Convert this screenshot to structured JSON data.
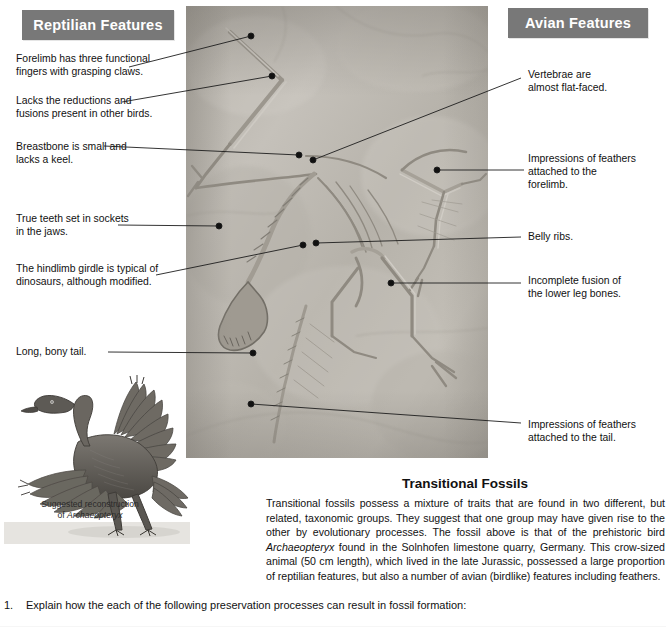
{
  "banners": {
    "reptilian": "Reptilian Features",
    "avian": "Avian Features",
    "bg_color": "#787878",
    "text_color": "#ffffff"
  },
  "callouts": {
    "left": [
      {
        "id": "forelimb-fingers",
        "text": "Forelimb has three functional\nfingers with grasping claws."
      },
      {
        "id": "lacks-reductions",
        "text": "Lacks the reductions and\nfusions present in other birds."
      },
      {
        "id": "breastbone",
        "text": "Breastbone is small and\nlacks a keel."
      },
      {
        "id": "true-teeth",
        "text": "True teeth set in sockets\nin the jaws."
      },
      {
        "id": "hindlimb-girdle",
        "text": "The hindlimb girdle is typical of\ndinosaurs, although modified."
      },
      {
        "id": "bony-tail",
        "text": "Long, bony tail."
      }
    ],
    "right": [
      {
        "id": "vertebrae",
        "text": "Vertebrae are\nalmost flat-faced."
      },
      {
        "id": "feathers-forelimb",
        "text": "Impressions of feathers\nattached to the\nforelimb."
      },
      {
        "id": "belly-ribs",
        "text": "Belly ribs."
      },
      {
        "id": "incomplete-fusion",
        "text": "Incomplete fusion of\nthe lower leg bones."
      },
      {
        "id": "feathers-tail",
        "text": "Impressions of feathers\nattached to the tail."
      }
    ]
  },
  "reconstruction": {
    "caption_line1": "Suggested reconstruction",
    "caption_line2_prefix": "of ",
    "caption_line2_italic": "Archaeopteryx"
  },
  "transitional": {
    "title": "Transitional Fossils",
    "para_part1": "Transitional fossils possess a mixture of traits that are found in two different, but related, taxonomic groups. They suggest that one group may have given rise to the other by evolutionary processes. The fossil above is that of the prehistoric bird ",
    "para_italic": "Archaeopteryx",
    "para_part2": " found in the Solnhofen limestone quarry, Germany. This crow-sized animal (50 cm length), which lived in the late Jurassic, possessed a large proportion of reptilian features, but also a number of avian (birdlike) features including feathers."
  },
  "question": {
    "number": "1.",
    "text": "Explain how the each of the following preservation processes can result in fossil formation:"
  }
}
